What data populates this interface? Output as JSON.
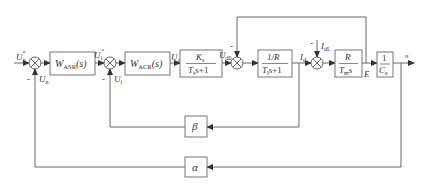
{
  "diagram": {
    "type": "double-closed-loop speed/current control block diagram",
    "blocks": [
      {
        "id": "asr",
        "label": "W",
        "sub": "ASR",
        "tail": "(s)"
      },
      {
        "id": "acr",
        "label": "W",
        "sub": "ACR",
        "tail": "(s)"
      },
      {
        "id": "converter",
        "num": "K",
        "num_sub": "s",
        "den": "T",
        "den_sub": "s",
        "den_tail": "s+1"
      },
      {
        "id": "armature",
        "num": "1/R",
        "den": "T",
        "den_sub": "l",
        "den_tail": "s+1"
      },
      {
        "id": "mechanical",
        "num": "R",
        "den": "T",
        "den_sub": "m",
        "den_tail": "s"
      },
      {
        "id": "emf",
        "num": "1",
        "den": "C",
        "den_sub": "e"
      },
      {
        "id": "beta",
        "label": "β"
      },
      {
        "id": "alpha",
        "label": "α"
      }
    ],
    "signals": {
      "un_star": {
        "main": "U",
        "sub": "n",
        "sup": "*"
      },
      "un": {
        "main": "U",
        "sub": "n"
      },
      "ui_star": {
        "main": "U",
        "sub": "i",
        "sup": "*"
      },
      "ui": {
        "main": "U",
        "sub": "i"
      },
      "uc": {
        "main": "U",
        "sub": "c"
      },
      "ud0": {
        "main": "U",
        "sub": "d0"
      },
      "id": {
        "main": "I",
        "sub": "d"
      },
      "idl": {
        "main": "I",
        "sub": "dL"
      },
      "e": {
        "main": "E"
      },
      "n": {
        "main": "n"
      }
    },
    "signs": {
      "minus": "-"
    }
  }
}
